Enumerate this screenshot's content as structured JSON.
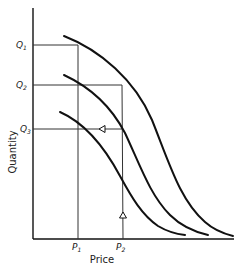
{
  "diagram": {
    "axes": {
      "x_label": "Price",
      "y_label": "Quantity"
    },
    "x_ticks": [
      {
        "label": "P",
        "sub": "1"
      },
      {
        "label": "P",
        "sub": "2"
      }
    ],
    "y_ticks": [
      {
        "label": "Q",
        "sub": "1"
      },
      {
        "label": "Q",
        "sub": "2"
      },
      {
        "label": "Q",
        "sub": "3"
      }
    ],
    "curves": [
      {
        "name": "upper-curve"
      },
      {
        "name": "middle-curve"
      },
      {
        "name": "lower-curve"
      }
    ],
    "arrows": [
      {
        "name": "left-arrow",
        "direction": "left"
      },
      {
        "name": "up-arrow",
        "direction": "up"
      }
    ],
    "colors": {
      "line": "#111111",
      "guide": "#333333",
      "background": "#ffffff"
    }
  }
}
